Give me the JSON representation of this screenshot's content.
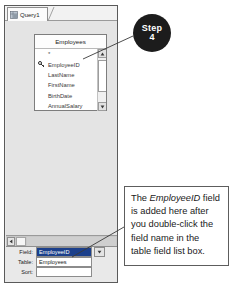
{
  "window": {
    "tab": {
      "label": "Query1",
      "icon": "query-grid-icon"
    }
  },
  "field_list": {
    "title": "Employees",
    "rows": [
      {
        "label": "*",
        "key": false
      },
      {
        "label": "EmployeeID",
        "key": true
      },
      {
        "label": "LastName",
        "key": false
      },
      {
        "label": "FirstName",
        "key": false
      },
      {
        "label": "BirthDate",
        "key": false
      },
      {
        "label": "AnnualSalary",
        "key": false
      }
    ],
    "scrollbar": {
      "up_icon": "scroll-up-arrow-icon",
      "down_icon": "scroll-down-arrow-icon"
    }
  },
  "splitter": {
    "left_button_icon": "scroll-left-arrow-icon"
  },
  "qbe_grid": {
    "rows": [
      {
        "label": "Field:",
        "value": "EmployeeID",
        "selected": true
      },
      {
        "label": "Table:",
        "value": "Employees",
        "selected": false
      },
      {
        "label": "Sort:",
        "value": "",
        "selected": false
      }
    ],
    "dropdown_icon": "chevron-down-icon"
  },
  "callouts": {
    "step_badge": {
      "word": "Step",
      "number": "4"
    },
    "note": {
      "line1_a": "The ",
      "line1_em": "EmployeeID",
      "line1_b": " field",
      "line2": "is added here after",
      "line3": "you double-click the",
      "line4": "field name in the",
      "line5": "table field list box."
    }
  },
  "colors": {
    "selection_blue": "#1b3f8b",
    "badge_black": "#1c1c1c",
    "surface_gray": "#e4e4e4",
    "window_border": "#5a5a5a"
  }
}
